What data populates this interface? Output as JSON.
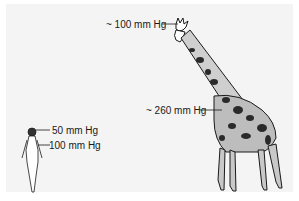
{
  "figure": {
    "labels": {
      "giraffe_head": "~ 100 mm Hg",
      "giraffe_heart": "~ 260 mm Hg",
      "human_head": "50 mm Hg",
      "human_heart": "100 mm Hg"
    },
    "subjects": [
      "giraffe",
      "human"
    ],
    "colors": {
      "background": "#f4f4f4",
      "ink": "#1a1a1a"
    }
  }
}
